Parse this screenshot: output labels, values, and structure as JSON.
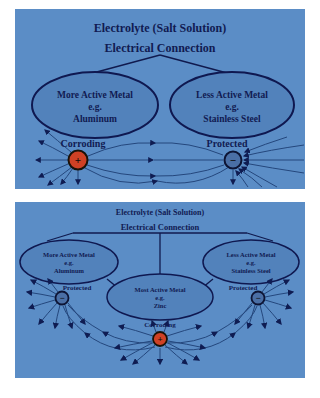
{
  "colors": {
    "panel_bg": "#5b8dc6",
    "ellipse_fill": "#5282bb",
    "outline_navy": "#0f1850",
    "text_navy": "#111b52",
    "corroding_node": "#cf4125",
    "protected_node": "#4a6fa5",
    "field_line": "#24477d"
  },
  "diagram_top": {
    "title": "Electrolyte (Salt Solution)",
    "subtitle": "Electrical Connection",
    "left_ellipse": {
      "line1": "More Active Metal",
      "line2": "e.g.",
      "line3": "Aluminum"
    },
    "right_ellipse": {
      "line1": "Less Active Metal",
      "line2": "e.g.",
      "line3": "Stainless Steel"
    },
    "left_node": {
      "label": "Corroding",
      "sign": "+"
    },
    "right_node": {
      "label": "Protected",
      "sign": "−"
    }
  },
  "diagram_bottom": {
    "title": "Electrolyte (Salt Solution)",
    "subtitle": "Electrical Connection",
    "left_ellipse": {
      "line1": "More Active Metal",
      "line2": "e.g.",
      "line3": "Aluminum"
    },
    "center_ellipse": {
      "line1": "Most Active Metal",
      "line2": "e.g.",
      "line3": "Zinc"
    },
    "right_ellipse": {
      "line1": "Less Active Metal",
      "line2": "e.g.",
      "line3": "Stainless Steel"
    },
    "left_node": {
      "label": "Protected",
      "sign": "−"
    },
    "center_node": {
      "label": "Corroding",
      "sign": "+"
    },
    "right_node": {
      "label": "Protected",
      "sign": "−"
    }
  }
}
